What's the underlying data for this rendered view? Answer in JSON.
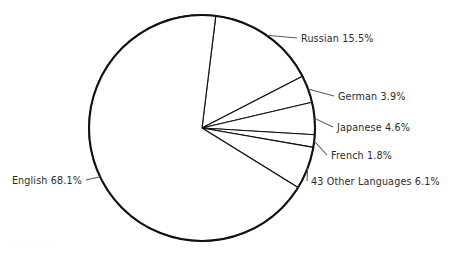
{
  "chart_data": {
    "type": "pie",
    "title": "",
    "subtitle": "",
    "xlabel": "",
    "ylabel": "",
    "legend_position": "none",
    "grid": false,
    "units": "percent",
    "total": 100.0,
    "start_angle_deg": 7,
    "direction": "clockwise",
    "categories": [
      "English",
      "Russian",
      "German",
      "Japanese",
      "French",
      "43 Other Languages"
    ],
    "values": [
      68.1,
      15.5,
      3.9,
      4.6,
      1.8,
      6.1
    ],
    "slices": [
      {
        "name": "English",
        "value": 68.1,
        "label": "English 68.1%",
        "value_text": "68.1%",
        "label_side": "left"
      },
      {
        "name": "Russian",
        "value": 15.5,
        "label": "Russian 15.5%",
        "value_text": "15.5%",
        "label_side": "right"
      },
      {
        "name": "German",
        "value": 3.9,
        "label": "German 3.9%",
        "value_text": "3.9%",
        "label_side": "right"
      },
      {
        "name": "Japanese",
        "value": 4.6,
        "label": "Japanese 4.6%",
        "value_text": "4.6%",
        "label_side": "right"
      },
      {
        "name": "French",
        "value": 1.8,
        "label": "French 1.8%",
        "value_text": "1.8%",
        "label_side": "right"
      },
      {
        "name": "43 Other Languages",
        "value": 6.1,
        "label": "43 Other Languages 6.1%",
        "value_text": "6.1%",
        "label_side": "right"
      }
    ]
  },
  "style": {
    "background_color": "#ffffff",
    "slice_fill_color": "#ffffff",
    "outline_color": "#111111",
    "leader_line_color": "#5a5a5a",
    "text_color": "#2b2b2b"
  },
  "geometry": {
    "center_x": 202,
    "center_y": 128,
    "radius": 113
  },
  "labels": {
    "english": "English 68.1%",
    "russian": "Russian 15.5%",
    "german": "German 3.9%",
    "japanese": "Japanese 4.6%",
    "french": "French 1.8%",
    "other": "43 Other Languages 6.1%"
  }
}
